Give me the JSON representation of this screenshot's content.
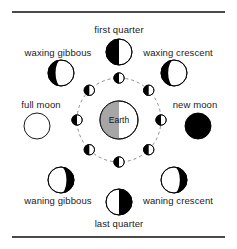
{
  "figure": {
    "background_color": "#ffffff",
    "line_color": "#000000",
    "rule_color": "#4a4a4a",
    "dark_color": "#000000",
    "light_color": "#ffffff",
    "earth_shadow_color": "#a6a6a6"
  },
  "center": {
    "label": "Earth",
    "cx": 119,
    "cy": 120,
    "r": 19,
    "lit_side": "right",
    "shadow_side": "left"
  },
  "orbit": {
    "cx": 119,
    "cy": 120,
    "r": 42,
    "style": "dashed",
    "dash": "3 3"
  },
  "orbit_moons": {
    "r": 5.2,
    "note": "small moons on the dashed orbit, each half dark on the left and half light on the right",
    "dark_side": "left",
    "positions": [
      {
        "name": "orbit-moon-top",
        "angle_deg": 90
      },
      {
        "name": "orbit-moon-upper-left",
        "angle_deg": 135
      },
      {
        "name": "orbit-moon-left",
        "angle_deg": 180
      },
      {
        "name": "orbit-moon-lower-left",
        "angle_deg": 225
      },
      {
        "name": "orbit-moon-bottom",
        "angle_deg": 270
      },
      {
        "name": "orbit-moon-lower-right",
        "angle_deg": 315
      },
      {
        "name": "orbit-moon-right",
        "angle_deg": 0
      },
      {
        "name": "orbit-moon-upper-right",
        "angle_deg": 45
      }
    ]
  },
  "phases": [
    {
      "id": "first-quarter",
      "label": "first quarter",
      "angle_deg": 90,
      "cx": 119,
      "cy": 52,
      "r": 13,
      "type": "half",
      "dark_side": "left",
      "label_x": 119,
      "label_y": 29,
      "label_align": "center"
    },
    {
      "id": "waxing-gibbous",
      "label": "waxing gibbous",
      "angle_deg": 135,
      "cx": 61,
      "cy": 73,
      "r": 13,
      "type": "gibbous",
      "dark_side": "left",
      "label_x": 58,
      "label_y": 52,
      "label_align": "center"
    },
    {
      "id": "waxing-crescent",
      "label": "waxing crescent",
      "angle_deg": 45,
      "cx": 174,
      "cy": 73,
      "r": 13,
      "type": "crescent",
      "dark_side": "left",
      "label_x": 178,
      "label_y": 52,
      "label_align": "center"
    },
    {
      "id": "full-moon",
      "label": "full moon",
      "angle_deg": 180,
      "cx": 37,
      "cy": 126,
      "r": 13,
      "type": "full",
      "dark_side": "none",
      "label_x": 41,
      "label_y": 104,
      "label_align": "center"
    },
    {
      "id": "new-moon",
      "label": "new moon",
      "angle_deg": 0,
      "cx": 198,
      "cy": 126,
      "r": 13,
      "type": "new",
      "dark_side": "all",
      "label_x": 195,
      "label_y": 104,
      "label_align": "center"
    },
    {
      "id": "waning-gibbous",
      "label": "waning gibbous",
      "angle_deg": 225,
      "cx": 61,
      "cy": 180,
      "r": 13,
      "type": "gibbous",
      "dark_side": "right",
      "label_x": 58,
      "label_y": 200,
      "label_align": "center"
    },
    {
      "id": "waning-crescent",
      "label": "waning crescent",
      "angle_deg": 315,
      "cx": 174,
      "cy": 180,
      "r": 13,
      "type": "crescent",
      "dark_side": "right",
      "label_x": 178,
      "label_y": 200,
      "label_align": "center"
    },
    {
      "id": "last-quarter",
      "label": "last quarter",
      "angle_deg": 270,
      "cx": 119,
      "cy": 202,
      "r": 13,
      "type": "half",
      "dark_side": "right",
      "label_x": 119,
      "label_y": 223,
      "label_align": "center"
    }
  ]
}
